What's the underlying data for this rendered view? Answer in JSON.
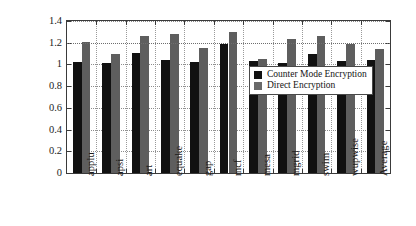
{
  "chart_data": {
    "type": "bar",
    "title": "",
    "subtitle": "",
    "xlabel": "",
    "ylabel": "Normalized EDP",
    "ylim": [
      0,
      1.4
    ],
    "ytick_labels": [
      "0",
      "0.2",
      "0.4",
      "0.6",
      "0.8",
      "1",
      "1.2",
      "1.4"
    ],
    "ytick_values": [
      0,
      0.2,
      0.4,
      0.6,
      0.8,
      1.0,
      1.2,
      1.4
    ],
    "grid": "horizontal-and-vertical-dotted",
    "legend_position": "inside-center-right",
    "categories": [
      "applu",
      "apsi",
      "art",
      "equake",
      "gap",
      "mcf",
      "mesa",
      "mgrid",
      "swim",
      "wupwise",
      "Average"
    ],
    "series": [
      {
        "name": "Counter Mode Encryption",
        "color": "#111111",
        "values": [
          1.02,
          1.01,
          1.11,
          1.04,
          1.02,
          1.19,
          1.03,
          1.01,
          1.1,
          1.03,
          1.04
        ]
      },
      {
        "name": "Direct Encryption",
        "color": "#5e5e5e",
        "values": [
          1.21,
          1.1,
          1.26,
          1.28,
          1.15,
          1.3,
          1.05,
          1.23,
          1.26,
          1.19,
          1.14
        ]
      }
    ],
    "reference_lines": [
      {
        "value": 1.2,
        "style": "dotted"
      }
    ]
  },
  "legend": {
    "items": [
      {
        "label": "Counter Mode Encryption"
      },
      {
        "label": "Direct Encryption"
      }
    ]
  }
}
